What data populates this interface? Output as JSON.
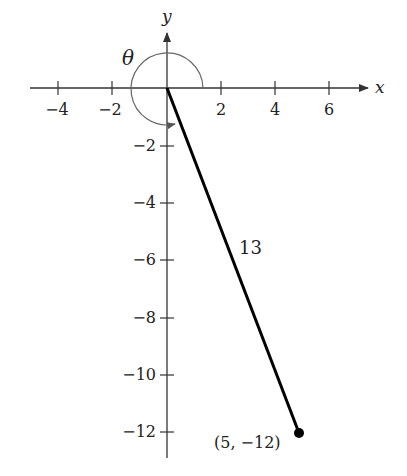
{
  "figure": {
    "axes": {
      "x_label": "x",
      "y_label": "y",
      "x_ticks": [
        {
          "value": -4,
          "label": "−4"
        },
        {
          "value": -2,
          "label": "−2"
        },
        {
          "value": 2,
          "label": "2"
        },
        {
          "value": 4,
          "label": "4"
        },
        {
          "value": 6,
          "label": "6"
        }
      ],
      "y_ticks": [
        {
          "value": -2,
          "label": "−2"
        },
        {
          "value": -4,
          "label": "−4"
        },
        {
          "value": -6,
          "label": "−6"
        },
        {
          "value": -8,
          "label": "−8"
        },
        {
          "value": -10,
          "label": "−10"
        },
        {
          "value": -12,
          "label": "−12"
        }
      ]
    },
    "angle_label": "θ",
    "segment": {
      "from": [
        0,
        0
      ],
      "to": [
        5,
        -12
      ],
      "length_label": "13"
    },
    "point_label": "(5, −12)",
    "colors": {
      "axis": "#333333",
      "segment": "#000000",
      "arc": "#666666"
    }
  }
}
